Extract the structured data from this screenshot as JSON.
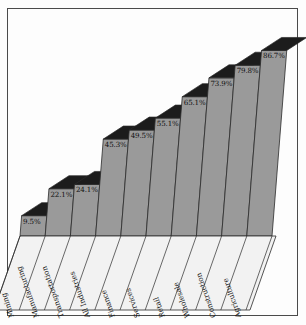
{
  "chart_data": {
    "type": "bar",
    "title": "",
    "subtitle": "",
    "xlabel": "",
    "ylabel": "",
    "ylim": [
      0,
      100
    ],
    "grid": false,
    "legend": "none",
    "style": "3d-sheared-bars",
    "categories": [
      "Mining",
      "Manufacturing",
      "Transportation",
      "All Industries",
      "Finance",
      "Services",
      "Retail",
      "Wholesale",
      "Construction",
      "Agriculture"
    ],
    "values": [
      9.5,
      22.1,
      24.1,
      45.3,
      49.5,
      55.1,
      65.1,
      73.9,
      79.8,
      86.7
    ],
    "data_labels": [
      "9.5%",
      "22.1%",
      "24.1%",
      "45.3%",
      "49.5%",
      "55.1%",
      "65.1%",
      "73.9%",
      "79.8%",
      "86.7%"
    ]
  },
  "colors": {
    "bar_face": "#9a9a9a",
    "bar_side": "#8e8e8e",
    "bar_top": "#1c1c1c",
    "outline": "#2b2b2b",
    "label_panel": "#f2f2f2",
    "background": "#fdfdfd",
    "border": "#4a4a4a",
    "text": "#111111"
  }
}
